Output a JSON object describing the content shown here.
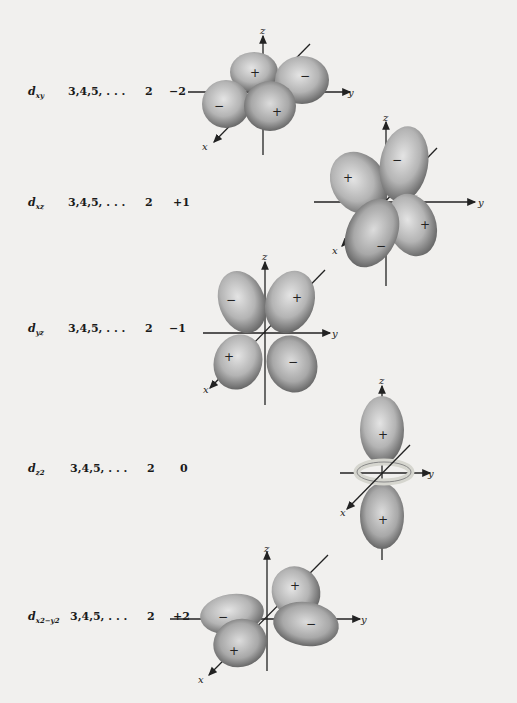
{
  "rows": [
    {
      "orbital_base": "d",
      "orbital_sub": "xy",
      "n": "3,4,5, . . .",
      "l": "2",
      "m": "−2",
      "signs": [
        "+",
        "−",
        "−",
        "+"
      ]
    },
    {
      "orbital_base": "d",
      "orbital_sub": "xz",
      "n": "3,4,5, . . .",
      "l": "2",
      "m": "+1",
      "signs": [
        "+",
        "−",
        "+",
        "−"
      ]
    },
    {
      "orbital_base": "d",
      "orbital_sub": "yz",
      "n": "3,4,5, . . .",
      "l": "2",
      "m": "−1",
      "signs": [
        "−",
        "+",
        "+",
        "−"
      ]
    },
    {
      "orbital_base": "d",
      "orbital_sub": "z2",
      "n": "3,4,5, . . .",
      "l": "2",
      "m": "0",
      "signs": [
        "+",
        "+"
      ]
    },
    {
      "orbital_base": "d",
      "orbital_sub": "x2−y2",
      "n": "3,4,5, . . .",
      "l": "2",
      "m": "+2",
      "signs": [
        "−",
        "+",
        "+",
        "−"
      ]
    }
  ],
  "axes": {
    "x": "x",
    "y": "y",
    "z": "z"
  },
  "colors": {
    "lobe_light": "#d8d8d8",
    "lobe_dark": "#6a6a6a",
    "background": "#f1f0ee",
    "ink": "#1a1a1a"
  }
}
